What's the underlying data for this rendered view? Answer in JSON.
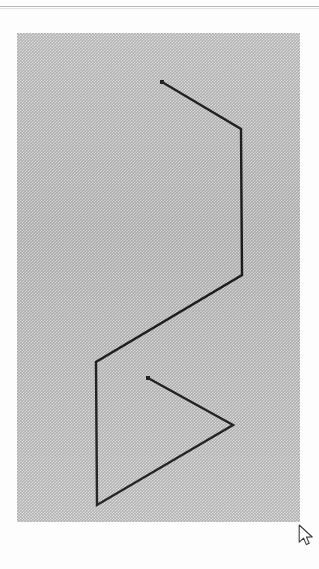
{
  "page": {
    "background_color": "#fdfdfd",
    "width": 319,
    "height": 569,
    "rule_color": "#b9b9b9"
  },
  "figure_panel": {
    "name": "figure-panel",
    "x": 17,
    "y": 33,
    "width": 283,
    "height": 489,
    "fill_color": "#adadad",
    "texture": "halftone-dither"
  },
  "drawing": {
    "type": "polyline",
    "stroke_color": "#1a1a1a",
    "stroke_width": 2.4,
    "endpoint_marker": "square-dot",
    "endpoint_marker_size": 4,
    "points": [
      {
        "label": "start",
        "x": 162,
        "y": 82
      },
      {
        "label": "v2",
        "x": 241,
        "y": 129
      },
      {
        "label": "v3",
        "x": 242,
        "y": 275
      },
      {
        "label": "v4",
        "x": 96,
        "y": 362
      },
      {
        "label": "v5",
        "x": 97,
        "y": 505
      },
      {
        "label": "v6",
        "x": 233,
        "y": 425
      },
      {
        "label": "end",
        "x": 148,
        "y": 378
      }
    ]
  },
  "cursor": {
    "name": "mouse-cursor",
    "shape": "arrow-pointer",
    "x": 298,
    "y": 524,
    "fill_color": "#ffffff",
    "outline_color": "#3a3a3a"
  }
}
